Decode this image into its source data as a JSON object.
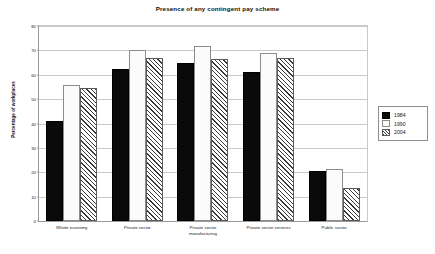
{
  "chart_data": {
    "type": "bar",
    "title": "Presence of any contingent pay scheme",
    "xlabel": "",
    "ylabel": "Percentage of workplaces",
    "ylim": [
      0,
      80
    ],
    "yticks": [
      0,
      10,
      20,
      30,
      40,
      50,
      60,
      70,
      80
    ],
    "grid": true,
    "legend_position": "right",
    "categories": [
      "Whole economy",
      "Private sector",
      "Private sector\nmanufacturing",
      "Private sector services",
      "Public sector"
    ],
    "series": [
      {
        "name": "1984",
        "values": [
          41,
          62.5,
          65,
          61,
          20.5
        ]
      },
      {
        "name": "1990",
        "values": [
          56,
          70,
          72,
          69,
          21.5
        ]
      },
      {
        "name": "2004",
        "values": [
          54.5,
          67,
          66.5,
          67,
          13.5
        ]
      }
    ]
  },
  "legend": {
    "entries": [
      {
        "label": "1984",
        "swatch": "black-dotted-swatch"
      },
      {
        "label": "1990",
        "swatch": "white-dotted-swatch"
      },
      {
        "label": "2004",
        "swatch": "checkered-swatch"
      }
    ]
  },
  "colors": {
    "series_1984": "#0a0a0a",
    "series_1990": "#fbfbfb",
    "series_2004": "#ffffff",
    "grid": "#c9c9c9",
    "axis": "#9a9a9a",
    "text": "#101010",
    "background": "#ffffff"
  }
}
